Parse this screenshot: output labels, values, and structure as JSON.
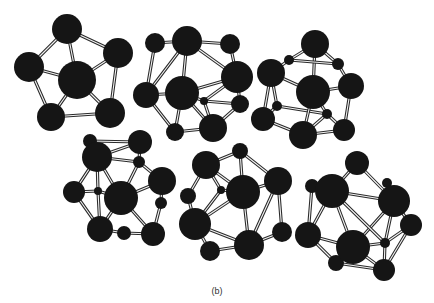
{
  "figure": {
    "caption": "(b)",
    "atom_color": "#151515",
    "bond_color": "#2a2a2a",
    "clusters": [
      {
        "name": "cluster-1",
        "atoms": [
          [
            67,
            29,
            15
          ],
          [
            29,
            67,
            15
          ],
          [
            77,
            80,
            19
          ],
          [
            118,
            53,
            15
          ],
          [
            51,
            117,
            14
          ],
          [
            110,
            113,
            15
          ]
        ],
        "bonds": [
          [
            0,
            1
          ],
          [
            0,
            2
          ],
          [
            0,
            3
          ],
          [
            1,
            2
          ],
          [
            1,
            4
          ],
          [
            2,
            3
          ],
          [
            2,
            4
          ],
          [
            2,
            5
          ],
          [
            3,
            5
          ],
          [
            4,
            5
          ]
        ]
      },
      {
        "name": "cluster-2",
        "atoms": [
          [
            155,
            43,
            10
          ],
          [
            187,
            41,
            15
          ],
          [
            230,
            44,
            10
          ],
          [
            146,
            95,
            13
          ],
          [
            182,
            93,
            17
          ],
          [
            237,
            77,
            16
          ],
          [
            204,
            101,
            4
          ],
          [
            240,
            104,
            9
          ],
          [
            175,
            132,
            9
          ],
          [
            213,
            128,
            14
          ],
          [
            157,
            60,
            0
          ]
        ],
        "bonds": [
          [
            0,
            1
          ],
          [
            1,
            2
          ],
          [
            0,
            3
          ],
          [
            1,
            4
          ],
          [
            1,
            5
          ],
          [
            2,
            5
          ],
          [
            3,
            4
          ],
          [
            4,
            5
          ],
          [
            4,
            6
          ],
          [
            5,
            6
          ],
          [
            5,
            7
          ],
          [
            6,
            7
          ],
          [
            3,
            8
          ],
          [
            4,
            8
          ],
          [
            6,
            9
          ],
          [
            8,
            9
          ],
          [
            7,
            9
          ],
          [
            1,
            3
          ],
          [
            4,
            9
          ]
        ]
      },
      {
        "name": "cluster-3",
        "atoms": [
          [
            315,
            44,
            14
          ],
          [
            289,
            60,
            5
          ],
          [
            338,
            64,
            6
          ],
          [
            271,
            73,
            14
          ],
          [
            313,
            92,
            17
          ],
          [
            351,
            86,
            13
          ],
          [
            277,
            106,
            5
          ],
          [
            327,
            114,
            5
          ],
          [
            263,
            119,
            12
          ],
          [
            303,
            135,
            14
          ],
          [
            344,
            130,
            11
          ]
        ],
        "bonds": [
          [
            0,
            1
          ],
          [
            0,
            2
          ],
          [
            0,
            4
          ],
          [
            1,
            3
          ],
          [
            2,
            5
          ],
          [
            3,
            4
          ],
          [
            4,
            5
          ],
          [
            3,
            6
          ],
          [
            5,
            10
          ],
          [
            6,
            7
          ],
          [
            4,
            7
          ],
          [
            6,
            8
          ],
          [
            3,
            8
          ],
          [
            7,
            9
          ],
          [
            8,
            9
          ],
          [
            9,
            10
          ],
          [
            7,
            10
          ],
          [
            4,
            9
          ],
          [
            1,
            2
          ]
        ]
      },
      {
        "name": "cluster-4",
        "atoms": [
          [
            90,
            141,
            7
          ],
          [
            97,
            157,
            15
          ],
          [
            140,
            142,
            12
          ],
          [
            139,
            162,
            6
          ],
          [
            74,
            192,
            11
          ],
          [
            98,
            191,
            4
          ],
          [
            121,
            198,
            17
          ],
          [
            162,
            181,
            14
          ],
          [
            161,
            203,
            6
          ],
          [
            100,
            229,
            13
          ],
          [
            124,
            233,
            7
          ],
          [
            153,
            234,
            12
          ]
        ],
        "bonds": [
          [
            1,
            2
          ],
          [
            0,
            2
          ],
          [
            1,
            3
          ],
          [
            2,
            3
          ],
          [
            3,
            6
          ],
          [
            3,
            7
          ],
          [
            1,
            4
          ],
          [
            1,
            5
          ],
          [
            4,
            5
          ],
          [
            5,
            6
          ],
          [
            6,
            7
          ],
          [
            7,
            8
          ],
          [
            4,
            9
          ],
          [
            5,
            9
          ],
          [
            9,
            10
          ],
          [
            10,
            11
          ],
          [
            6,
            11
          ],
          [
            8,
            11
          ],
          [
            6,
            9
          ],
          [
            1,
            6
          ]
        ]
      },
      {
        "name": "cluster-5",
        "atoms": [
          [
            240,
            151,
            8
          ],
          [
            206,
            165,
            14
          ],
          [
            278,
            181,
            14
          ],
          [
            243,
            192,
            17
          ],
          [
            221,
            190,
            4
          ],
          [
            188,
            196,
            8
          ],
          [
            195,
            224,
            16
          ],
          [
            282,
            232,
            10
          ],
          [
            249,
            245,
            15
          ],
          [
            210,
            251,
            10
          ]
        ],
        "bonds": [
          [
            0,
            1
          ],
          [
            0,
            3
          ],
          [
            0,
            2
          ],
          [
            1,
            3
          ],
          [
            1,
            4
          ],
          [
            1,
            5
          ],
          [
            2,
            3
          ],
          [
            2,
            7
          ],
          [
            3,
            4
          ],
          [
            3,
            6
          ],
          [
            3,
            8
          ],
          [
            4,
            6
          ],
          [
            5,
            6
          ],
          [
            6,
            8
          ],
          [
            6,
            9
          ],
          [
            8,
            9
          ],
          [
            7,
            8
          ],
          [
            2,
            8
          ]
        ]
      },
      {
        "name": "cluster-6",
        "atoms": [
          [
            357,
            163,
            12
          ],
          [
            312,
            186,
            7
          ],
          [
            332,
            191,
            17
          ],
          [
            387,
            183,
            5
          ],
          [
            394,
            201,
            16
          ],
          [
            411,
            225,
            11
          ],
          [
            308,
            235,
            13
          ],
          [
            353,
            247,
            17
          ],
          [
            385,
            243,
            5
          ],
          [
            336,
            263,
            8
          ],
          [
            384,
            270,
            11
          ]
        ],
        "bonds": [
          [
            0,
            2
          ],
          [
            0,
            4
          ],
          [
            2,
            4
          ],
          [
            3,
            4
          ],
          [
            2,
            6
          ],
          [
            1,
            6
          ],
          [
            2,
            7
          ],
          [
            4,
            7
          ],
          [
            4,
            5
          ],
          [
            4,
            8
          ],
          [
            5,
            8
          ],
          [
            6,
            7
          ],
          [
            7,
            8
          ],
          [
            7,
            9
          ],
          [
            6,
            9
          ],
          [
            9,
            10
          ],
          [
            8,
            10
          ],
          [
            7,
            10
          ],
          [
            5,
            10
          ],
          [
            2,
            8
          ],
          [
            1,
            2
          ]
        ]
      }
    ]
  }
}
